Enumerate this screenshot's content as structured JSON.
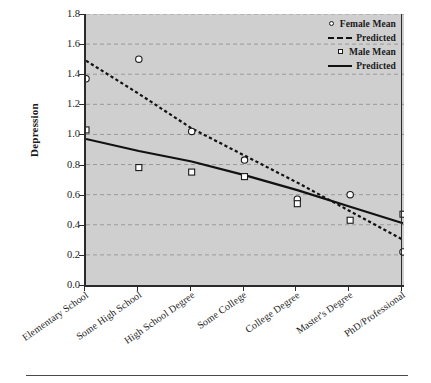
{
  "chart_data": {
    "type": "scatter",
    "title": "",
    "xlabel": "",
    "ylabel": "Depression",
    "categories": [
      "Elementary School",
      "Some High School",
      "High School Degree",
      "Some College",
      "College Degree",
      "Master's Degree",
      "PhD/Professional"
    ],
    "ylim": [
      0.0,
      1.8
    ],
    "yticks": [
      "0.0",
      "0.2",
      "0.4",
      "0.6",
      "0.8",
      "1.0",
      "1.2",
      "1.4",
      "1.6",
      "1.8"
    ],
    "ytick_values": [
      0.0,
      0.2,
      0.4,
      0.6,
      0.8,
      1.0,
      1.2,
      1.4,
      1.6,
      1.8
    ],
    "grid": true,
    "grid_style": "dashed-horizontal",
    "legend_position": "top-right",
    "series": [
      {
        "name": "Female Mean",
        "marker": "circle",
        "style": "points",
        "values": [
          1.37,
          1.5,
          1.02,
          0.83,
          0.57,
          0.6,
          0.22
        ]
      },
      {
        "name": "Predicted",
        "marker": "none",
        "style": "dashed-line",
        "series_for": "Female",
        "values": [
          1.49,
          1.27,
          1.04,
          0.86,
          0.68,
          0.49,
          0.3
        ]
      },
      {
        "name": "Male Mean",
        "marker": "square",
        "style": "points",
        "values": [
          1.03,
          0.78,
          0.75,
          0.72,
          0.54,
          0.43,
          0.47
        ]
      },
      {
        "name": "Predicted",
        "marker": "none",
        "style": "solid-line",
        "series_for": "Male",
        "values": [
          0.97,
          0.89,
          0.82,
          0.73,
          0.63,
          0.52,
          0.41
        ]
      }
    ]
  },
  "axis": {
    "y_title": "Depression"
  },
  "legend": {
    "entries": [
      {
        "label": "Female Mean",
        "key": "circle-marker"
      },
      {
        "label": "Predicted",
        "key": "dashed-line"
      },
      {
        "label": "Male Mean",
        "key": "square-marker"
      },
      {
        "label": "Predicted",
        "key": "solid-line"
      }
    ]
  },
  "colors": {
    "plot_background": "#cfcfcf",
    "axis": "#2b2b2b",
    "grid": "#9a9a9a",
    "line": "#111111",
    "marker_fill": "#ffffff",
    "page_background": "#ffffff"
  }
}
